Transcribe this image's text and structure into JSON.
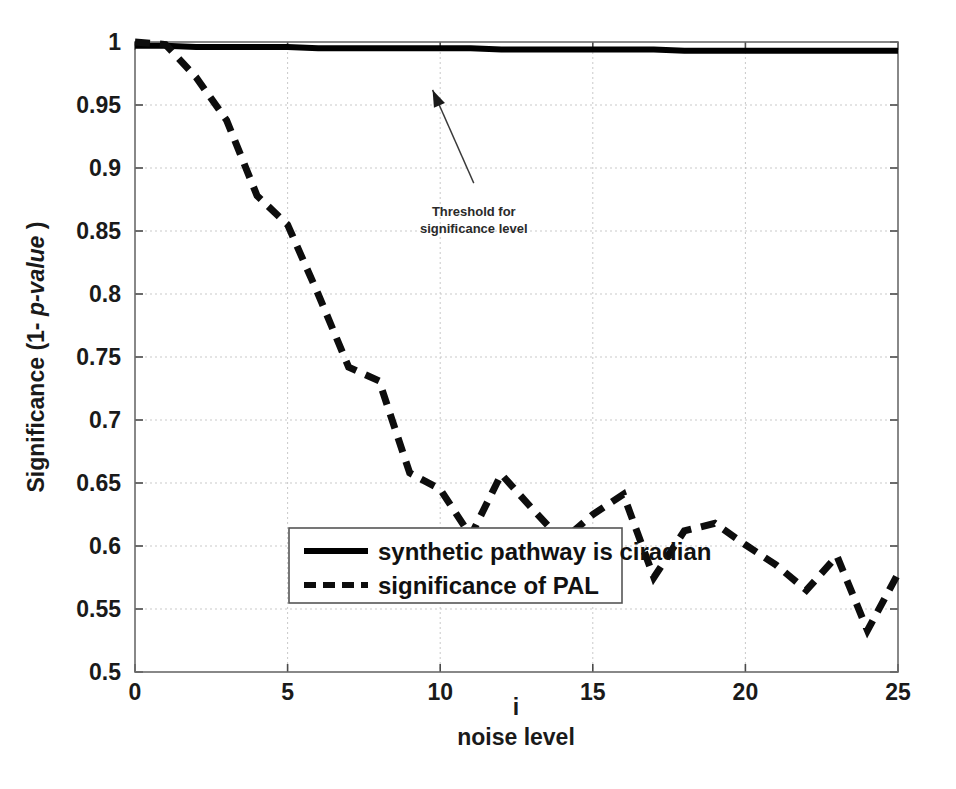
{
  "chart_data": {
    "type": "line",
    "title": "",
    "subtitle": "",
    "xlabel_line1": "i",
    "xlabel_line2": "noise level",
    "ylabel_prefix": "Significance (1- ",
    "ylabel_italic": "p-value",
    "ylabel_suffix": " )",
    "xlim": [
      0,
      25
    ],
    "ylim": [
      0.5,
      1.0
    ],
    "xticks": [
      0,
      5,
      10,
      15,
      20,
      25
    ],
    "xtick_labels": [
      "0",
      "5",
      "10",
      "15",
      "20",
      "25"
    ],
    "yticks": [
      0.5,
      0.55,
      0.6,
      0.65,
      0.7,
      0.75,
      0.8,
      0.85,
      0.9,
      0.95,
      1.0
    ],
    "ytick_labels": [
      "0.5",
      "0.55",
      "0.6",
      "0.65",
      "0.7",
      "0.75",
      "0.8",
      "0.85",
      "0.9",
      "0.95",
      "1"
    ],
    "grid": true,
    "legend_position": "lower-center",
    "x": [
      0,
      1,
      2,
      3,
      4,
      5,
      6,
      7,
      8,
      9,
      10,
      11,
      12,
      13,
      14,
      15,
      16,
      17,
      18,
      19,
      20,
      21,
      22,
      23,
      24,
      25
    ],
    "series": [
      {
        "name": "synthetic pathway is ciradian",
        "style": "solid",
        "color": "#000000",
        "values": [
          0.997,
          0.997,
          0.996,
          0.996,
          0.996,
          0.996,
          0.995,
          0.995,
          0.995,
          0.995,
          0.995,
          0.995,
          0.994,
          0.994,
          0.994,
          0.994,
          0.994,
          0.994,
          0.993,
          0.993,
          0.993,
          0.993,
          0.993,
          0.993,
          0.993,
          0.993
        ]
      },
      {
        "name": "significance of PAL",
        "style": "dashed",
        "color": "#0d0d0d",
        "values": [
          1.0,
          0.998,
          0.972,
          0.938,
          0.878,
          0.855,
          0.8,
          0.742,
          0.731,
          0.658,
          0.645,
          0.608,
          0.657,
          0.63,
          0.604,
          0.625,
          0.641,
          0.575,
          0.612,
          0.618,
          0.601,
          0.585,
          0.565,
          0.592,
          0.533,
          0.578
        ]
      }
    ],
    "annotations": [
      {
        "name": "threshold-annotation",
        "text_line1": "Threshold for",
        "text_line2": "significance level",
        "text_x": 11.1,
        "text_y": 0.862,
        "arrow_from_x": 11.1,
        "arrow_from_y": 0.888,
        "arrow_to_x": 9.75,
        "arrow_to_y": 0.962
      }
    ],
    "legend_entries": [
      {
        "label": "synthetic pathway is ciradian",
        "style": "solid"
      },
      {
        "label": "significance of PAL",
        "style": "dashed"
      }
    ]
  }
}
